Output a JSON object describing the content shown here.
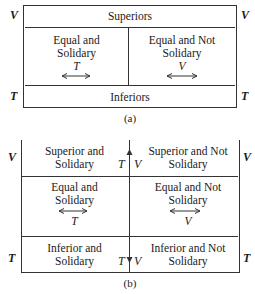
{
  "diagram_a": {
    "caption": "(a)",
    "side_labels": {
      "top_left": "V",
      "top_right": "V",
      "bottom_left": "T",
      "bottom_right": "T"
    },
    "top_band": "Superiors",
    "left_cell": {
      "line1": "Equal and",
      "line2": "Solidary",
      "symbol": "T",
      "arrow": "left-right"
    },
    "right_cell": {
      "line1": "Equal and Not",
      "line2": "Solidary",
      "symbol": "V",
      "arrow": "left-right"
    },
    "bottom_band": "Inferiors"
  },
  "diagram_b": {
    "caption": "(b)",
    "side_labels": {
      "top_left": "V",
      "top_right": "V",
      "bottom_left": "T",
      "bottom_right": "T"
    },
    "rows": [
      {
        "left": {
          "line1": "Superior and",
          "line2": "Solidary"
        },
        "right": {
          "line1": "Superior and Not",
          "line2": "Solidary"
        }
      },
      {
        "left": {
          "line1": "Equal and",
          "line2": "Solidary",
          "symbol": "T"
        },
        "right": {
          "line1": "Equal and Not",
          "line2": "Solidary",
          "symbol": "V"
        }
      },
      {
        "left": {
          "line1": "Inferior and",
          "line2": "Solidary"
        },
        "right": {
          "line1": "Inferior and Not",
          "line2": "Solidary"
        }
      }
    ],
    "center_axis": {
      "top_left_symbol": "T",
      "top_right_symbol": "V",
      "bottom_left_symbol": "T",
      "bottom_right_symbol": "V",
      "top_arrow": "up",
      "bottom_arrow": "down"
    }
  }
}
